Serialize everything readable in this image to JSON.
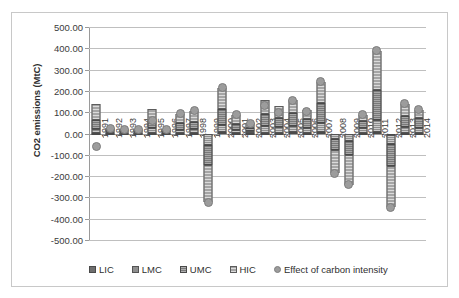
{
  "chart_data": {
    "type": "bar",
    "title": "",
    "xlabel": "",
    "ylabel": "CO2 emissions (MtC)",
    "ylim": [
      -500,
      500
    ],
    "ytick_step": 100,
    "ytick_labels": [
      "500.00",
      "400.00",
      "300.00",
      "200.00",
      "100.00",
      "0.00",
      "-100.00",
      "-200.00",
      "-300.00",
      "-400.00",
      "-500.00"
    ],
    "grid": true,
    "legend_position": "bottom",
    "stacked": true,
    "categories": [
      "1991",
      "1992",
      "1993",
      "1994",
      "1995",
      "1996",
      "1997",
      "1998",
      "1999",
      "2000",
      "2001",
      "2002",
      "2003",
      "2004",
      "2005",
      "2006",
      "2007",
      "2008",
      "2009",
      "2010",
      "2011",
      "2012",
      "2013",
      "2014"
    ],
    "series": [
      {
        "name": "LIC",
        "values": [
          3,
          2,
          2,
          2,
          3,
          2,
          3,
          3,
          -4,
          5,
          3,
          2,
          4,
          4,
          5,
          4,
          6,
          -3,
          -4,
          4,
          7,
          -5,
          4,
          4
        ]
      },
      {
        "name": "LMC",
        "values": [
          18,
          9,
          7,
          7,
          22,
          8,
          14,
          16,
          -48,
          34,
          14,
          10,
          30,
          26,
          32,
          24,
          44,
          -22,
          -30,
          20,
          56,
          -44,
          26,
          24
        ]
      },
      {
        "name": "UMC",
        "values": [
          44,
          8,
          6,
          6,
          40,
          6,
          30,
          36,
          -96,
          78,
          26,
          14,
          56,
          44,
          58,
          40,
          92,
          -52,
          -66,
          36,
          140,
          -104,
          50,
          44
        ]
      },
      {
        "name": "HIC",
        "values": [
          74,
          6,
          5,
          5,
          52,
          5,
          46,
          52,
          -174,
          98,
          44,
          22,
          66,
          56,
          62,
          42,
          102,
          -110,
          -140,
          26,
          186,
          -194,
          58,
          40
        ]
      },
      {
        "name": "Effect of carbon intensity",
        "type": "scatter",
        "values": [
          -60,
          25,
          20,
          20,
          60,
          21,
          93,
          107,
          -322,
          214,
          87,
          48,
          130,
          100,
          157,
          104,
          244,
          -187,
          -240,
          90,
          389,
          -347,
          142,
          112
        ]
      }
    ],
    "legend": [
      {
        "label": "LIC",
        "marker": "square",
        "color": "#6e6e6e"
      },
      {
        "label": "LMC",
        "marker": "square",
        "color": "#8f8f8f"
      },
      {
        "label": "UMC",
        "marker": "square",
        "color": "#7a7a7a"
      },
      {
        "label": "HIC",
        "marker": "square",
        "color": "#a5a5a5"
      },
      {
        "label": "Effect of carbon intensity",
        "marker": "circle",
        "color": "#9c9c9c"
      }
    ]
  }
}
